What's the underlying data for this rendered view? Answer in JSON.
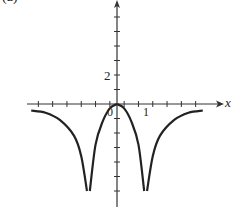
{
  "panel_label": "(a)",
  "axes": {
    "x_name": "x",
    "tick_labels": {
      "y_2": "2",
      "origin": "0",
      "x_1": "1"
    }
  },
  "colors": {
    "axis": "#333333",
    "curve": "#222222",
    "background": "#ffffff"
  },
  "chart_data": {
    "type": "line",
    "title": "(a)",
    "xlabel": "x",
    "ylabel": "",
    "xlim": [
      -3.1,
      3.6
    ],
    "ylim": [
      -7,
      7
    ],
    "x_tick_step": 0.5,
    "y_tick_step": 1,
    "labeled_ticks": {
      "x": [
        0,
        1
      ],
      "y": [
        2
      ]
    },
    "grid": false,
    "legend": null,
    "annotations": [
      "vertical asymptotes at x = -1 and x = 1",
      "curve touches origin (0,0) as a local maximum"
    ],
    "series": [
      {
        "name": "left-outer",
        "x": [
          -3,
          -2.5,
          -2,
          -1.5,
          -1.25,
          -1.05
        ],
        "y": [
          -0.45,
          -0.6,
          -1.1,
          -2.2,
          -3.6,
          -6
        ]
      },
      {
        "name": "left-inner",
        "x": [
          -0.95,
          -0.75,
          -0.5,
          -0.25,
          0
        ],
        "y": [
          -6,
          -2.8,
          -1.2,
          -0.3,
          0
        ]
      },
      {
        "name": "right-inner",
        "x": [
          0,
          0.25,
          0.5,
          0.75,
          0.95
        ],
        "y": [
          0,
          -0.3,
          -1.2,
          -2.8,
          -6
        ]
      },
      {
        "name": "right-outer",
        "x": [
          1.05,
          1.25,
          1.5,
          2,
          2.5,
          3
        ],
        "y": [
          -6,
          -3.6,
          -2.2,
          -1.1,
          -0.6,
          -0.45
        ]
      }
    ]
  }
}
